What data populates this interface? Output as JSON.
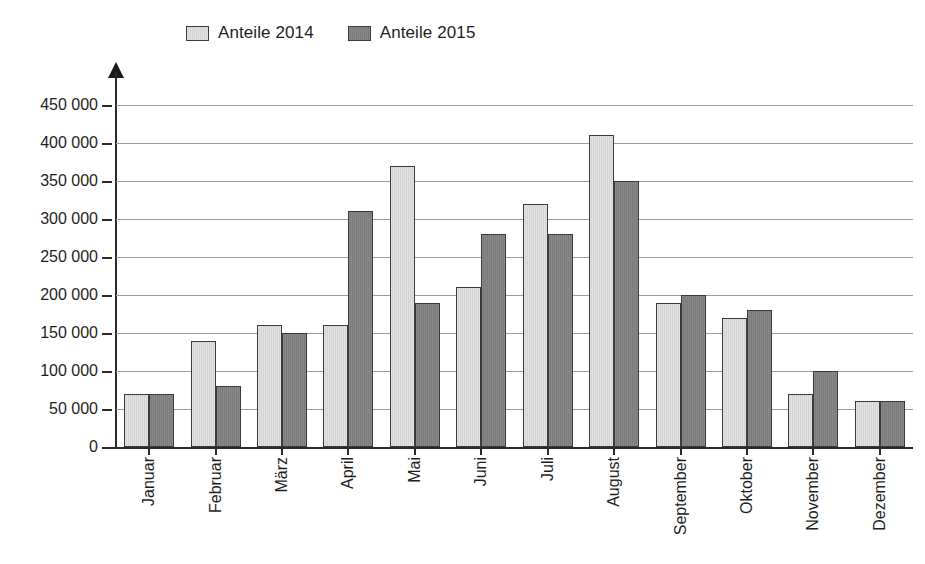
{
  "chart_data": {
    "type": "bar",
    "title": "",
    "subtitle": "",
    "xlabel": "",
    "ylabel": "",
    "categories": [
      "Januar",
      "Februar",
      "März",
      "April",
      "Mai",
      "Juni",
      "Juli",
      "August",
      "September",
      "Oktober",
      "November",
      "Dezember"
    ],
    "series": [
      {
        "name": "Anteile 2014",
        "color": "#dcdcdc",
        "values": [
          70000,
          140000,
          160000,
          160000,
          370000,
          210000,
          320000,
          410000,
          190000,
          170000,
          70000,
          60000
        ]
      },
      {
        "name": "Anteile 2015",
        "color": "#808080",
        "values": [
          70000,
          80000,
          150000,
          310000,
          190000,
          280000,
          280000,
          350000,
          200000,
          180000,
          100000,
          60000
        ]
      }
    ],
    "ylim": [
      0,
      450000
    ],
    "ytick_values": [
      0,
      50000,
      100000,
      150000,
      200000,
      250000,
      300000,
      350000,
      400000,
      450000
    ],
    "ytick_labels": [
      "0",
      "50 000",
      "100 000",
      "150 000",
      "200 000",
      "250 000",
      "300 000",
      "350 000",
      "400 000",
      "450 000"
    ],
    "grid": true,
    "grid_axis": "y",
    "legend_position": "top-left",
    "annotations": []
  },
  "legend": {
    "items": [
      {
        "label": "Anteile 2014",
        "swatch": "legend-swatch-light"
      },
      {
        "label": "Anteile 2015",
        "swatch": "legend-swatch-dark"
      }
    ]
  },
  "axis": {
    "y_arrow": "y-axis-arrow"
  }
}
